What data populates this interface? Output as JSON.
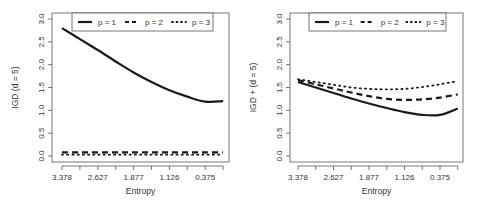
{
  "chart_data": [
    {
      "type": "line",
      "title": "",
      "xlabel": "Entropy",
      "ylabel": "IGD  (d = 5)",
      "x_tick_labels": [
        "3.378",
        "2.627",
        "1.877",
        "1.126",
        "0.375"
      ],
      "x": [
        3.378,
        3.003,
        2.627,
        2.252,
        1.877,
        1.501,
        1.126,
        0.751,
        0.375,
        0.0
      ],
      "ylim": [
        0,
        3
      ],
      "y_ticks": [
        "0.0",
        "0.5",
        "1.0",
        "1.5",
        "2.0",
        "2.5",
        "3.0"
      ],
      "grid": false,
      "legend_position": "top",
      "series": [
        {
          "name": "p = 1",
          "style": "solid",
          "values": [
            2.8,
            2.56,
            2.32,
            2.07,
            1.83,
            1.62,
            1.44,
            1.3,
            1.19,
            1.2
          ]
        },
        {
          "name": "p = 2",
          "style": "dashed",
          "values": [
            0.08,
            0.08,
            0.08,
            0.08,
            0.08,
            0.08,
            0.08,
            0.08,
            0.08,
            0.08
          ]
        },
        {
          "name": "p = 3",
          "style": "dotted",
          "values": [
            0.03,
            0.03,
            0.03,
            0.03,
            0.03,
            0.03,
            0.03,
            0.03,
            0.03,
            0.03
          ]
        }
      ]
    },
    {
      "type": "line",
      "title": "",
      "xlabel": "Entropy",
      "ylabel": "IGD +  (d = 5)",
      "x_tick_labels": [
        "3.378",
        "2.627",
        "1.877",
        "1.126",
        "0.375"
      ],
      "x": [
        3.378,
        3.003,
        2.627,
        2.252,
        1.877,
        1.501,
        1.126,
        0.751,
        0.375,
        0.0
      ],
      "ylim": [
        0,
        3
      ],
      "y_ticks": [
        "0.0",
        "0.5",
        "1.0",
        "1.5",
        "2.0",
        "2.5",
        "3.0"
      ],
      "grid": false,
      "legend_position": "top",
      "series": [
        {
          "name": "p = 1",
          "style": "solid",
          "values": [
            1.62,
            1.5,
            1.38,
            1.26,
            1.15,
            1.05,
            0.96,
            0.9,
            0.9,
            1.04
          ]
        },
        {
          "name": "p = 2",
          "style": "dashed",
          "values": [
            1.66,
            1.57,
            1.48,
            1.39,
            1.31,
            1.25,
            1.23,
            1.24,
            1.28,
            1.35
          ]
        },
        {
          "name": "p = 3",
          "style": "dotted",
          "values": [
            1.68,
            1.62,
            1.56,
            1.5,
            1.47,
            1.46,
            1.47,
            1.51,
            1.57,
            1.64
          ]
        }
      ]
    }
  ],
  "panels": [
    {
      "ylabel": "IGD  (d = 5)",
      "xlabel": "Entropy",
      "legend": [
        "p = 1",
        "p = 2",
        "p = 3"
      ],
      "x_tick_labels": [
        "3.378",
        "2.627",
        "1.877",
        "1.126",
        "0.375"
      ],
      "y_tick_labels": [
        "0.0",
        "0.5",
        "1.0",
        "1.5",
        "2.0",
        "2.5",
        "3.0"
      ]
    },
    {
      "ylabel": "IGD +  (d = 5)",
      "xlabel": "Entropy",
      "legend": [
        "p = 1",
        "p = 2",
        "p = 3"
      ],
      "x_tick_labels": [
        "3.378",
        "2.627",
        "1.877",
        "1.126",
        "0.375"
      ],
      "y_tick_labels": [
        "0.0",
        "0.5",
        "1.0",
        "1.5",
        "2.0",
        "2.5",
        "3.0"
      ]
    }
  ],
  "colors": {
    "line": "#1a1a1a",
    "axis": "#555555",
    "text": "#333333"
  }
}
